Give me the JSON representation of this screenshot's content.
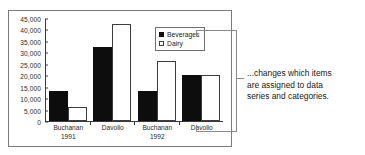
{
  "chart_data": {
    "type": "bar",
    "title": "",
    "xlabel": "",
    "ylabel": "",
    "grid": false,
    "legend_position": "top-right",
    "ylim": [
      0,
      45000
    ],
    "yticks": [
      "45,000",
      "40,000",
      "35,000",
      "30,000",
      "25,000",
      "20,000",
      "15,000",
      "10,000",
      "5,000",
      "0"
    ],
    "ytick_values": [
      45000,
      40000,
      35000,
      30000,
      25000,
      20000,
      15000,
      10000,
      5000,
      0
    ],
    "categories": [
      {
        "name": "Buchanan",
        "sub": "1991"
      },
      {
        "name": "Davolio",
        "sub": ""
      },
      {
        "name": "Buchanan",
        "sub": "1992"
      },
      {
        "name": "Davolio",
        "sub": ""
      }
    ],
    "series": [
      {
        "name": "Beverages",
        "color": "#0d0d0d",
        "fill": "solid",
        "values": [
          13200,
          32500,
          13000,
          20000
        ]
      },
      {
        "name": "Dairy",
        "color": "#ffffff",
        "fill": "hollow",
        "values": [
          6000,
          42500,
          26000,
          20000
        ]
      }
    ]
  },
  "legend": {
    "items": [
      {
        "label": "Beverages",
        "swatch": "filled-square"
      },
      {
        "label": "Dairy",
        "swatch": "hollow-square"
      }
    ]
  },
  "annotation": {
    "lines": [
      "...changes which items",
      "are assigned to data",
      "series and categories."
    ]
  }
}
